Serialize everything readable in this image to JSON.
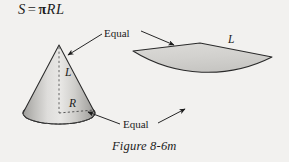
{
  "figure": {
    "formula": {
      "lhs": "S",
      "equals": "=",
      "pi": "π",
      "rhs": "RL",
      "full_text": "S = πRL"
    },
    "caption": "Figure 8-6m",
    "labels": {
      "equal_top": "Equal",
      "equal_bottom": "Equal",
      "cone_slant": "L",
      "cone_radius": "R",
      "sector_radius": "L"
    },
    "colors": {
      "background": "#f2f1ef",
      "ink": "#1b1b1b",
      "shape_fill_light": "#e3e2e0",
      "shape_fill_mid": "#cfcecb",
      "shape_fill_dark": "#a9a8a5",
      "sector_fill": "#d2d1ce",
      "outline": "#2a2a2a",
      "dashed": "#5a5a5a"
    },
    "shapes": {
      "cone": {
        "name": "right-circular-cone",
        "apex": [
          59,
          45
        ],
        "base_center": [
          59,
          113
        ],
        "base_radius_x": 36,
        "base_radius_y": 11,
        "axis_style": "dashed",
        "hidden_base_arc_style": "dashed",
        "radius_line_style": "dashed"
      },
      "sector": {
        "name": "unrolled-lateral-surface-sector",
        "apex": [
          133,
          51
        ],
        "radius": 140,
        "tip_right": [
          272,
          57
        ],
        "arc_low_point": [
          203,
          122
        ]
      }
    },
    "arrows": [
      {
        "name": "arrow-equal-top-to-cone-slant",
        "from": [
          103,
          33
        ],
        "to": [
          66,
          55
        ]
      },
      {
        "name": "arrow-equal-top-to-sector-edge",
        "from": [
          140,
          31
        ],
        "to": [
          176,
          46
        ]
      },
      {
        "name": "arrow-equal-bottom-to-cone-base",
        "from": [
          121,
          124
        ],
        "to": [
          86,
          111
        ]
      },
      {
        "name": "arrow-equal-bottom-to-sector-arc",
        "from": [
          158,
          122
        ],
        "to": [
          186,
          108
        ]
      }
    ]
  }
}
